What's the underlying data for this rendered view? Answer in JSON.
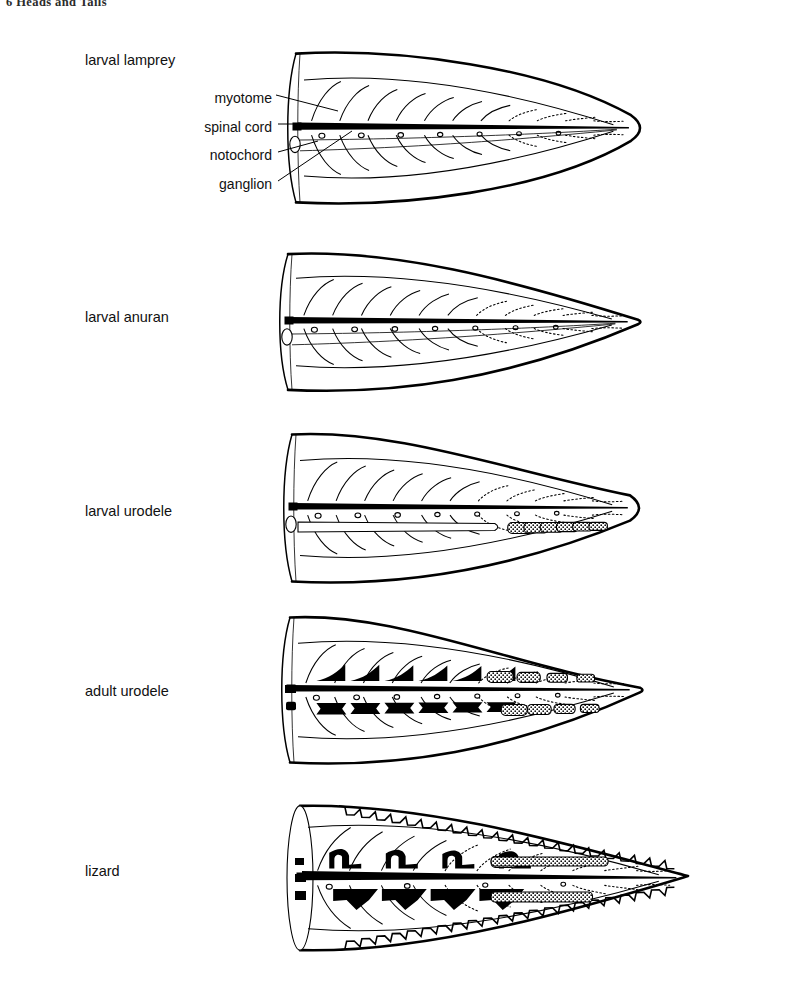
{
  "running_head": "6  Heads and Tails",
  "figure": {
    "caption_labels": [
      "myotome",
      "spinal cord",
      "notochord",
      "ganglion"
    ],
    "specimen_rows": [
      {
        "label": "larval lamprey",
        "label_x": 85,
        "label_y": 61,
        "kind": "lamprey",
        "origin_x": 296,
        "origin_y": 128,
        "length": 345,
        "half_height": 80,
        "tail_shape": "broad-rounded-leaf",
        "ganglia_count": 7,
        "notochord": "continuous-unsegmented",
        "vertebrae": "none",
        "neural_spines": "none",
        "dorsal_edge": "smooth",
        "has_part_labels": true
      },
      {
        "label": "larval anuran",
        "label_x": 85,
        "label_y": 318,
        "kind": "anuran",
        "origin_x": 288,
        "origin_y": 322,
        "length": 352,
        "half_height": 73,
        "tail_shape": "narrow-pointed-leaf",
        "ganglia_count": 7,
        "notochord": "continuous-unsegmented",
        "vertebrae": "none",
        "neural_spines": "none",
        "dorsal_edge": "smooth",
        "has_part_labels": false
      },
      {
        "label": "larval urodele",
        "label_x": 85,
        "label_y": 512,
        "kind": "larval-urodele",
        "origin_x": 292,
        "origin_y": 508,
        "length": 348,
        "half_height": 79,
        "tail_shape": "broad-pointed-leaf",
        "ganglia_count": 7,
        "notochord": "terminating-outlined",
        "vertebrae": "stippled-centra",
        "vertebrae_count": 6,
        "neural_spines": "none",
        "dorsal_edge": "smooth",
        "has_part_labels": false
      },
      {
        "label": "adult urodele",
        "label_x": 85,
        "label_y": 692,
        "kind": "adult-urodele",
        "origin_x": 290,
        "origin_y": 690,
        "length": 352,
        "half_height": 78,
        "tail_shape": "tapering-pointed",
        "ganglia_count": 7,
        "notochord": "replaced-by-centra",
        "vertebrae": "solid-black-centra",
        "vertebrae_count": 6,
        "stippled_centra_count": 4,
        "neural_spines": "solid-black",
        "neural_spine_count": 6,
        "dorsal_edge": "smooth",
        "has_part_labels": false
      },
      {
        "label": "lizard",
        "label_x": 85,
        "label_y": 872,
        "kind": "lizard",
        "origin_x": 300,
        "origin_y": 878,
        "length": 390,
        "half_height": 82,
        "tail_shape": "long-narrow-tapered",
        "ganglia_count": 4,
        "notochord": "absent",
        "vertebrae": "solid-black-with-haemal-arches",
        "vertebrae_count": 4,
        "neural_spines": "solid-black-hooked",
        "neural_spine_count": 4,
        "dorsal_edge": "serrated-scales",
        "has_part_labels": false
      }
    ],
    "part_label_positions": [
      {
        "name": "myotome",
        "x": 272,
        "y": 99,
        "leader_to_x": 336,
        "leader_to_y": 112
      },
      {
        "name": "spinal cord",
        "x": 272,
        "y": 129,
        "leader_to_x": 313,
        "leader_to_y": 125
      },
      {
        "name": "notochord",
        "x": 272,
        "y": 157,
        "leader_to_x": 317,
        "leader_to_y": 143
      },
      {
        "name": "ganglion",
        "x": 272,
        "y": 186,
        "leader_to_x": 351,
        "leader_to_y": 133
      }
    ]
  },
  "colors": {
    "ink": "#000000",
    "paper": "#ffffff",
    "running_head": "#2b2b2b"
  }
}
